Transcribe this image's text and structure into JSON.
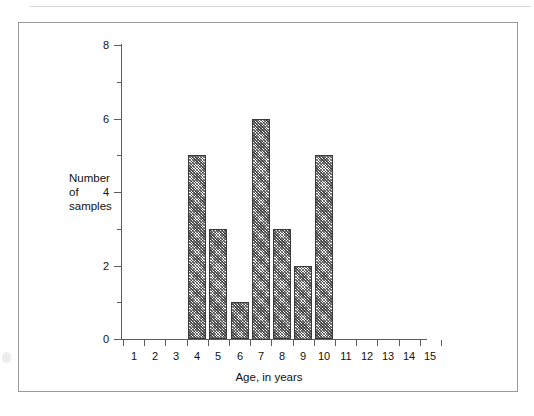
{
  "figure": {
    "frame_border_color": "#9a9a9a",
    "background_color": "#ffffff"
  },
  "chart_data": {
    "type": "bar",
    "title": "",
    "xlabel": "Age, in years",
    "ylabel": "Number of samples",
    "ylabel_lines": [
      "Number",
      "of",
      "samples"
    ],
    "categories": [
      "1",
      "2",
      "3",
      "4",
      "5",
      "6",
      "7",
      "8",
      "9",
      "10",
      "11",
      "12",
      "13",
      "14",
      "15"
    ],
    "values": [
      0,
      0,
      0,
      5,
      3,
      1,
      6,
      3,
      2,
      5,
      0,
      0,
      0,
      0,
      0
    ],
    "xlim": [
      0.5,
      15.5
    ],
    "ylim": [
      0,
      8
    ],
    "y_major_ticks": [
      0,
      2,
      4,
      6,
      8
    ],
    "y_major_tick_labels": [
      "0",
      "2",
      "4",
      "6",
      "8"
    ],
    "y_minor_ticks": [
      1,
      3,
      5,
      7
    ],
    "grid": false,
    "legend": false,
    "bar_fill": "diagonal-crosshatch",
    "bar_outline_color": "#3a3a3a",
    "axis_color": "#5c5c5c"
  }
}
